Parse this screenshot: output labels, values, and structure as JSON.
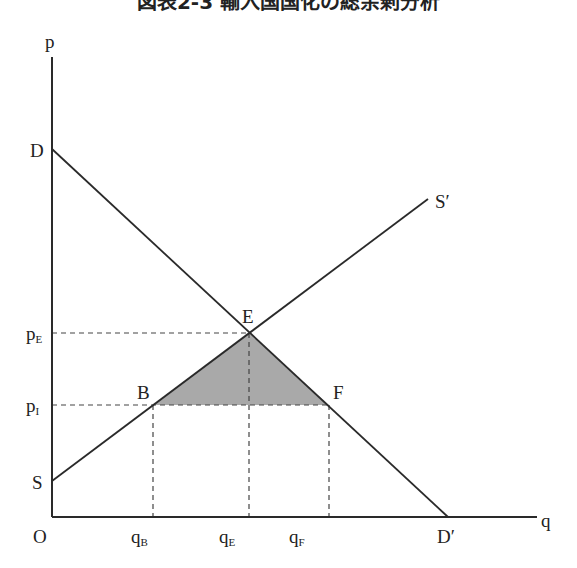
{
  "title": "図表2-3 輸入国国化の総余剰分析",
  "axes": {
    "y_label": "p",
    "x_label": "q",
    "origin_label": "O"
  },
  "curves": {
    "demand": {
      "start_label": "D",
      "end_label": "D′"
    },
    "supply": {
      "start_label": "S",
      "end_label": "S′"
    }
  },
  "points": {
    "E": "E",
    "B": "B",
    "F": "F"
  },
  "y_ticks": [
    {
      "main": "p",
      "sub": "E"
    },
    {
      "main": "p",
      "sub": "I"
    }
  ],
  "x_ticks": [
    {
      "main": "q",
      "sub": "B"
    },
    {
      "main": "q",
      "sub": "E"
    },
    {
      "main": "q",
      "sub": "F"
    }
  ],
  "colors": {
    "line": "#2a2a2a",
    "shaded_triangle": "#a9a9a9",
    "dashed": "#444444"
  }
}
